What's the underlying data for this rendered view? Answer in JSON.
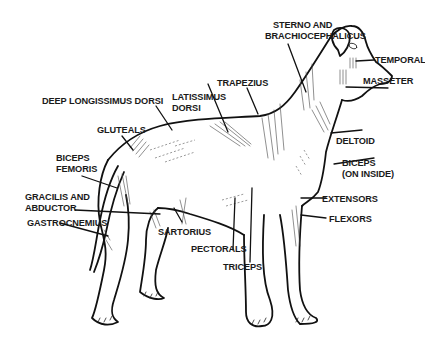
{
  "diagram": {
    "labels": [
      {
        "id": "sterno",
        "lines": [
          "STERNO AND",
          "BRACHIOCEPHALICUS"
        ]
      },
      {
        "id": "temporal",
        "lines": [
          "TEMPORAL"
        ]
      },
      {
        "id": "masseter",
        "lines": [
          "MASSETER"
        ]
      },
      {
        "id": "trapezius",
        "lines": [
          "TRAPEZIUS"
        ]
      },
      {
        "id": "latissimus",
        "lines": [
          "LATISSIMUS",
          "DORSI"
        ]
      },
      {
        "id": "longissimus",
        "lines": [
          "DEEP LONGISSIMUS  DORSI"
        ]
      },
      {
        "id": "gluteals",
        "lines": [
          "GLUTEALS"
        ]
      },
      {
        "id": "biceps_femoris",
        "lines": [
          "BICEPS",
          "FEMORIS"
        ]
      },
      {
        "id": "gracilis",
        "lines": [
          "GRACILIS AND",
          "ABDUCTOR"
        ]
      },
      {
        "id": "gastrocnemius",
        "lines": [
          "GASTROCNEMIUS"
        ]
      },
      {
        "id": "sartorius",
        "lines": [
          "SARTORIUS"
        ]
      },
      {
        "id": "pectorals",
        "lines": [
          "PECTORALS"
        ]
      },
      {
        "id": "triceps",
        "lines": [
          "TRICEPS"
        ]
      },
      {
        "id": "deltoid",
        "lines": [
          "DELTOID"
        ]
      },
      {
        "id": "biceps_inside",
        "lines": [
          "BICEPS",
          "(ON INSIDE)"
        ]
      },
      {
        "id": "extensors",
        "lines": [
          "EXTENSORS"
        ]
      },
      {
        "id": "flexors",
        "lines": [
          "FLEXORS"
        ]
      }
    ]
  }
}
